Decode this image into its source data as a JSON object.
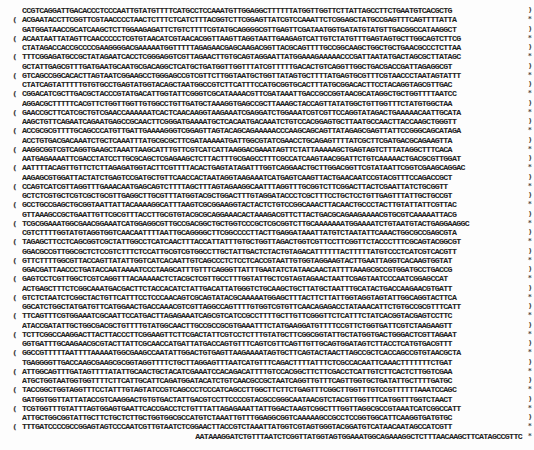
{
  "document": {
    "type": "nucleotide-sequence-page",
    "lines": [
      {
        "text": "CCGTCAGGATTGACACCCTCCCAATTGTATGTTTTCATGCCTCCAAATGTTGGAGGCTTTTTTATGGTTGGTTCTTATTAGCCTTCTGAATGTCACGCTG",
        "left": "",
        "right": ")"
      },
      {
        "text": "ACGAATACCTTCGGTTCGTAACCCCTAACTCTTTCTCATCTTTACGGTCTTCGGAGTTATCGTCCAAATTCTCGGAGCTATGCCGAGTTTCAGTTTTATTA",
        "left": "(",
        "right": "*"
      },
      {
        "text": "GATGGATAACCGCATCAAGCTCTTGGAAGAGATTCTGTCTTTTCGTATGCAGGGGCGTTGAGTTCGATAATGGTGATATGTATGTTGACGGCCATAAGGCT",
        "left": "",
        "right": ")"
      },
      {
        "text": "ACAATAATTATAGTTCAACCCCCTCGTGTAACATCGTAACACGGTTAAGTTAGGTAATTGAAGAGTCATTGTCTATGTTTGAGTAGTGCTTGGCAGTCTTCG",
        "left": "(",
        "right": "*"
      },
      {
        "text": "CTATAGACCACCGCCCCGAAGGGGACGAAAAATGGTTTTTAGAGAACGAGCAAGACGGTTACGCAGTTTTGCCGGCAAGCTGGCTGCTGAACGCCCTCTTAA",
        "left": "",
        "right": ")"
      },
      {
        "text": "TTTCGGAGATGCCGCTATAGAATCACCTCGGGAGGTCGTTAGAACTTGTGCAGTAGGAATTATGGAAAGAAAAACCCGATTAATATGACTAGCGCTTATAGC",
        "left": "(",
        "right": "*"
      },
      {
        "text": "GCTATTGAGCGTTTGATGAATGCAATGCGACAGGCTCATGCTGATGGTTGGTTTATCGTTTTTGACACTGTCAGGTTGGCTGACGACCGATTAGAGGCGT",
        "left": "",
        "right": ")"
      },
      {
        "text": "GTCAGCCGGCACACTTAGTAATCGGAAGCCTGGGAGCCGTCGTTCTTGGTAATGCTGGTTATAGTGCTTTTATGAGTGCGTTTCGTAACCCTAATAGTATTT",
        "left": "(",
        "right": "*"
      },
      {
        "text": "CTATCAGTATTTTTGTGTGCCTGAGTATGGTACAGCTAATGGCCGTCTTCATTTCCATGCGGTGCACTTTATGCGGACACTTCCTACAGGTAGCGTTGAC",
        "left": "",
        "right": ")"
      },
      {
        "text": "CGGACATCGCTTGACGCTACCCGTATGACATTGGTATTCGGGTCGCATAAAACGTTCGATAAATTGACCGCCGGTAACGCATAGGCTGCTGGTTTTAATCC",
        "left": "(",
        "right": "*"
      },
      {
        "text": "AGGACGCTTTTTCACGTTCTGGTTGGTTGTGGCCTGTTGATGCTAAAGGTGAGCCGCTTAAAGCTACCAGTTATATGGCTGTTGGTTTCTATGTGGCTAA",
        "left": "",
        "right": ")"
      },
      {
        "text": "GAACCGCTTCATCGCTGTCGAACCAAAAAATCACTCAACAAGGTAAGAAATCGAGGATCTGGAAATCGTCGTTCCAGGTATAGACTGAAAAACAATTGCATA",
        "left": "(",
        "right": "*"
      },
      {
        "text": "AAGCTGTTCAGAATCAGAATGAGCCGCAACTTCGGGATGAAAATGCTCACAATGACAAATCTGTCCACGGAGTGCTTAATGCCAACTTACCAAGCTGGGTT",
        "left": "",
        "right": ")"
      },
      {
        "text": "ACCGCGCGTTTTGCAGCCCATGTTGATTGAAAAGGGTCGGAGTTAGTACAGCAGAAAAACCCAAGCAGCAGTTATAGAGCGAGTTATTCCGGGCAGCATAGA",
        "left": "(",
        "right": "*"
      },
      {
        "text": "ACCTGTGACGACAAATCTGCTCAAATTTATGCGCGCTTCGATAAAAATGATTGGCGTATCGAACCTGCAGAGTTTTATCGCTTCGATGACGCAGAAGTTA",
        "left": "",
        "right": ")"
      },
      {
        "text": "AAGGCGGTCGTCAGGTGAAGCTAAATTAAGCATTTGTTCGTCATCATTAAGGACGAAATAGTTCTATTAAAAAGCTGAGTAGTCTTTATAGGCTTTCACA",
        "left": "(",
        "right": "*"
      },
      {
        "text": "AATGAGAAAATTCGACCTATCCTTGCGCAGCTCGAGAAGCTCTTACTTTGCGAGCCTTTCGCCATCAAGTAACGGATTCTGTCAAAAACTGACGCGTTGGAT",
        "left": "",
        "right": ")"
      },
      {
        "text": "AATTTTACAGTTGTTCTCTTAGAGATGGTACTTCGTTTTACACTGAGTATAGATTTGGTCAGGAACTGCTTGGACGGTTCGTATAATTCGGTCGAAGCAGGAC",
        "left": "(",
        "right": "*"
      },
      {
        "text": "AAGAGCGTGGATTACTATCTGAGTCCGATGCTGTTCAACCACTAATAGGTAAGAAATCATGAGTCAAGTTACTGAACAATCCGTACGTTTCCAGACCGCT",
        "left": "",
        "right": ")"
      },
      {
        "text": "CCAGTCATCGTTAGGTTTGAAACAATGAGCAGTCTTTTAGCTTTAGTAGAAGGCAATTTAGGTTTGCGGTCTTCGGACTTACTCGAATTATCTGCGGTT",
        "left": "(",
        "right": "*"
      },
      {
        "text": "GCTCTCGTGCTCGTCGCTGCGTTGAGGCTTGCGTTTATGGTACGCTGGACTTTGTAGGATACCCTCGCTTTCCTGCTCCTGTTGAGTTTATTGCTGCCGT",
        "left": "",
        "right": ")"
      },
      {
        "text": "GCCTGCCGAGCTGCGGTAATTATTACAAAAGGCATTTAAGTCGCGGAAGGTACTACTCTGTCCGGCAAACTTACAACTGCCCTACTTGTATTATTCGTTAC",
        "left": "(",
        "right": "*"
      },
      {
        "text": "GTTAAAGCCGCTGAATTGTTCGCGTTTACCTTGCGTGTACGCGCAGGAAACACTAAAGACGTTCTTACTGACGCAGAAGAAAACGTGCGTCAAAAATTACG",
        "left": "",
        "right": ")"
      },
      {
        "text": "TCGCGGAAATGGCGAACGGAAATCATGGAGGCGTTGCCGACGGCTGCTGGTCCCGCTCGCGGTCTTGCAAAAAAATGGAAAATCTGTAATGTACTGAGGAAGGC",
        "left": "(",
        "right": "*"
      },
      {
        "text": "CGTCTTTTGGTATGTAGGTGGTCAACAATTTTAATTGCAGGGGCTTCGGCCCCTTACTTGAGGATAAATTATGTCTAATATTCAAACTGGCGCCGAGCGTA",
        "left": "",
        "right": ")"
      },
      {
        "text": "TAGAGCTTCCTCAGCGGTCGCTATTGGCCTCATCAACTTTACCATTATTTGTGCTGGTTAGACTGGTCGTTCCTTCGGTTCTACCCTTTCGCAGTACGGCGT",
        "left": "(",
        "right": "*"
      },
      {
        "text": "GGACGCCGTTGGCGCTCTCCGTCTTTCTCCATTGCGTCGTGGCCTTGCTATTGACTCTACTGTAGACATTTTTTACTTTTTATGTCCCTCATCGTCACGTT",
        "left": "",
        "right": ")"
      },
      {
        "text": "GTTCTTTTGGCGTTACCAGTTATATTGGTCATCACAATTGTCAGCCCTCTCCTCACCGTAATTGTGGTAGGAAGTACTTGAATTAGGTCACAAGTGGTAT",
        "left": "(",
        "right": "*"
      },
      {
        "text": "GGACGATTAACCCTGATACCAATAAAATCCCTAAGCATTTGTTTCAGGGTTATTTGAATATCTATAACAACTATTTTAAAGCGCCGTGGATGCCTGACCG",
        "left": "",
        "right": ")"
      },
      {
        "text": "GAGTCCTCGTTGGCTCGTCAGGTTTACAAAAACTCTACGCTCGTTGCCTTTGGTATTGCTCGTAGTAGAACTAATTCGAGTAATCCCAATCGGAGCCAT",
        "left": "(",
        "right": "*"
      },
      {
        "text": "ACTGAGCTTTCTCGGCAAATGACGACTTCTACCACATCTATTGACATTATGGGTCTGCAAGCTGCTTATGCTAATTTGCATACTGACCAAGAACGTGATT",
        "left": "",
        "right": ")"
      },
      {
        "text": "GTCTCTAATCTCGGCTACTGTTCATTTCCTCCCAACAGTCGCAGTATACGCAAAAATGGAGCTTTACTTCTTATTGGTAGGTAGTATTGGCAGGTACTTCA",
        "left": "(",
        "right": "*"
      },
      {
        "text": "GGCATCTGGCTATGATGTTCATGGAACTGACCAAACGTCGTTAGGCCAGTTTTGTGGTCGTGTTCAACAGAGACCTATAAACATTCTGTGCCGCGTTTCATT",
        "left": "",
        "right": ")"
      },
      {
        "text": "TTCAGTTTCGTGGAAATCGCAATTCCATGACTTAGAGAAATCAGCGTCATCCGCCTTTTGCTTGTTCGGGTTCTCATTTCTATCACGGTACGAGTCCTTC",
        "left": "(",
        "right": "*"
      },
      {
        "text": "ATACCGATATTGCTGGCGACGCTGTTTTGTATGGCAACTTGCCGCCGCGTGAAATTTCTATGAAGGATGTTTTCCGTTCTGGTGATTCGTCTAAGAAGTT",
        "left": "",
        "right": ")"
      },
      {
        "text": "TCTTCGGCCAAGGACTTACTTACCCTTCGGAAGTTCTTCGACTATTCGTCCTCTTTGTATGCTTCGGCGGTATTGCTATGGTGACTGGGACTCGTTAGAAT",
        "left": "(",
        "right": "*"
      },
      {
        "text": "GGTGATTTGCAAGAACGCGTACTTATTCGCAACCATGATTATGACCAGTGTTTCAGTCGTTCAGTTGTTGCAGTGGATAGTCTTACCTCATGTGACGTTT",
        "left": "",
        "right": ")"
      },
      {
        "text": "GGCCGTTTTTAATTTTAAAAATGGCGAAGCCAATATTGGACTGTGAGTTAAGAAAATAGTGCTTCAGTACTAACTTAGCCGCTCACCAGCCGTGTAACGCTA",
        "left": "(",
        "right": "*"
      },
      {
        "text": "TGAGGGGTTGACCAAGCGAAGCGCGGTAGGTTTTCTGCTTAGGAGTTTAATCATGTTTCAGACTTTTATTTCTCGCCACAATTCAAACTTTTTTTCTGAT",
        "left": "",
        "right": ")"
      },
      {
        "text": "ATTGGCAGTTTGATAGTTTTATATTGCAACTGCTACATCGAAATCCACAGACATTTTGTCCACGGCTTCTTCGACCTCATTGTCTTCACTCTTGGTCGAA",
        "left": "(",
        "right": "*"
      },
      {
        "text": "ATGCTGGTAATGGTGGTTTTCTTCATTGCATTCAGATGGATACATCTGTCAACGCCGCTAATCAGGTTGTTTCAGTTGGTGCTGATATTGCTTTTGATGC",
        "left": "",
        "right": ")"
      },
      {
        "text": "TACCGGCTGGTAGGTTTCCTATTTGTAGTATCCGTCAGCCCTCCCATCAGCCTTGGCTTCTTCTGAGTTTCGGCTTGGTTTGTCCGTTTTTTAAATCCAGC",
        "left": "(",
        "right": "*"
      },
      {
        "text": "GATGGTGGTTATTATACCGTCAAGGACTGTGTGACTATTGACGTCCTTCCCCGTACGCCGGGCAATAACGTCTACGTTGGTTTCATGGTTTGGTCTAACT",
        "left": "",
        "right": ")"
      },
      {
        "text": "TCGTGGTTTGTATTTAGTGGAGTGAATTCACCGACCTCTGTTTATTAGAGAAATTATTGGACTAAGTCGGCTTTGGTTAGGCGCCGTAAATCATCGGCCATT",
        "left": "(",
        "right": "*"
      },
      {
        "text": "ATTGCTGGCGGTATTGCTTCTGCTCTTGCTGGTGGCGCCATGTCTAAATTGTTTGGAGGCGGTCAAAAAGCCGCCTCCGGTGGCATTCAAGGTGATGTGC",
        "left": "",
        "right": ")"
      },
      {
        "text": "TTTGATCCCCGCCGGAGTAGTCCCAATCGTTGTAATCTCGGAACTTACCGTCTAAATTATGGTCGTAGTGGGTACGGATGTCATAACAATAGCCATCGTT",
        "left": "(",
        "right": "*"
      },
      {
        "text": "TGTTTCTGGTGCTATGGCTAAAGCTGGTAAAGGACTTCTTGAAGGTACGTTGCAGGCTGGCACTTCTGCCGTTTCTGATAAGTTGCTTGATTTGGTTGGA",
        "left": "",
        "right": ")"
      },
      {
        "text": "GTAGTCGTGGTCGTCCGAGGGTTCGTAATTCGAGTCCTTTACCTCGTCGTTCTATTAGTGCTCATAGGAAAGGAAATAGTCGCCCTCTGAACGGTGGTTC",
        "left": "(",
        "right": "*"
      },
      {
        "text": "CTTCCTCTGCTGGTATGGTTGACGCCGGATTTGAGAATCAAAAAGAGCTTACTAAAATGCAACTGGACAATCAGAAAGAGATTGCCGAGATGCAAAATGA",
        "left": "",
        "right": ")"
      },
      {
        "text": "GAAGACAACTATTCCTTCGTAGAGTAAAACACGTATATCGACCAGAAGCATAAGACCCCACTTCAGCCGCTGACTTACCGTCGTTTAGAGAAAACTCAG",
        "left": "(",
        "right": "*"
      },
      {
        "text": "GAGTCTACTGCTCGCGTTGCGTCTATTATGGAAAACACCAATCTTTCCAAGCAACAGCAGGTTTCCGAGATTATGCGCCAAATGCTTACTCAAGCTCAAA",
        "left": "",
        "right": ")"
      },
      {
        "text": "ATGGCGACTAAGACGCAAACGACTACTTGATTCAGTTGGAGTCGTGATTGGAACGCTCAGTAAAGAAACTAAACCAGTAACGATTTTATGACTGGTCGGC",
        "left": "(",
        "right": "*"
      },
      {
        "text": "TGGCTCTTCTCATATTGGCGCTACTGCAAAGGATATTTCTAATGTCGTCACTGATGCTGCTTCTGGTGTGGTTGATATTTTTCATGGTATTGATAAAGCT",
        "left": "",
        "right": ")"
      },
      {
        "text": "AATAAAGGATCTGTTTAATCTCGGTTATGGTAGTGGAAATGGCAGAAAGGCTCTTTAACAAGCTTCATAGCCGTTC",
        "left": "",
        "right": "*",
        "align": "right"
      }
    ]
  }
}
